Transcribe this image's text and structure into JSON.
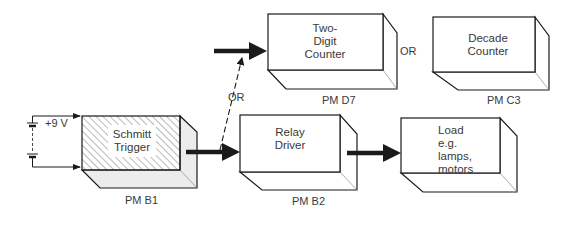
{
  "diagram": {
    "type": "block-diagram",
    "battery": {
      "label": "+9 V"
    },
    "blocks": [
      {
        "id": "schmitt",
        "lines": [
          "Schmitt",
          "Trigger"
        ],
        "module": "PM B1",
        "hatched": true
      },
      {
        "id": "two_digit",
        "lines": [
          "Two-",
          "Digit",
          "Counter"
        ],
        "module": "PM D7",
        "hatched": false
      },
      {
        "id": "decade",
        "lines": [
          "Decade",
          "Counter"
        ],
        "module": "PM C3",
        "hatched": false
      },
      {
        "id": "relay",
        "lines": [
          "Relay",
          "Driver"
        ],
        "module": "PM B2",
        "hatched": false
      },
      {
        "id": "load",
        "lines": [
          "Load",
          "e.g.",
          "lamps,",
          "motors"
        ],
        "module": "",
        "hatched": false
      }
    ],
    "or_labels": {
      "dashed_branch": "OR",
      "counter_alt": "OR"
    },
    "connections": [
      {
        "from": "battery",
        "to": "schmitt",
        "style": "thin"
      },
      {
        "from": "schmitt",
        "to": "relay",
        "style": "thick"
      },
      {
        "from": "schmitt",
        "to": "two_digit",
        "style": "dashed",
        "label": "OR"
      },
      {
        "from": "input",
        "to": "two_digit",
        "style": "thick"
      },
      {
        "from": "relay",
        "to": "load",
        "style": "thick"
      }
    ]
  }
}
